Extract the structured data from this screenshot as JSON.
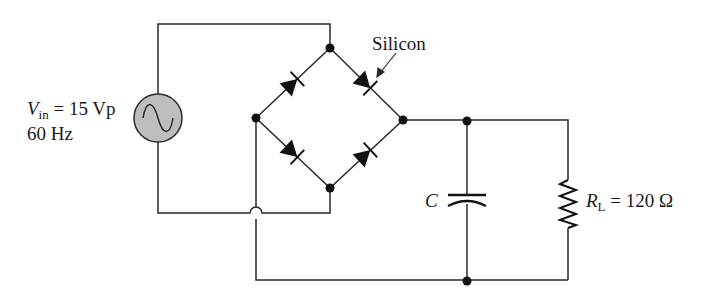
{
  "source": {
    "symbol": "V",
    "subscript": "in",
    "value": "= 15 Vp",
    "frequency": "60 Hz",
    "fill_color": "#bdbdbd"
  },
  "bridge": {
    "diode_label": "Silicon",
    "diode_count": 4
  },
  "capacitor": {
    "label": "C"
  },
  "load": {
    "symbol": "R",
    "subscript": "L",
    "value": "= 120 Ω"
  },
  "colors": {
    "wire": "#2a2a2a",
    "background": "#ffffff"
  }
}
